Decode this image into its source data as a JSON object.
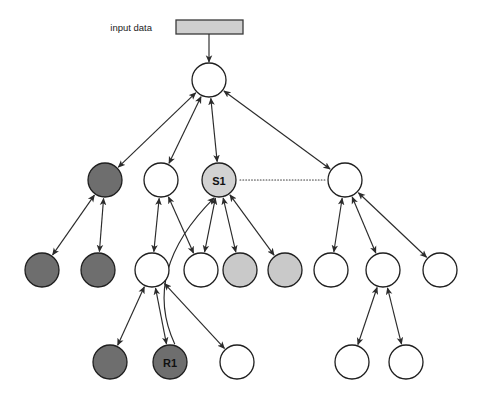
{
  "figure": {
    "title": "",
    "background": "#ffffff",
    "width": 479,
    "height": 403
  },
  "input_block": {
    "label": "input data",
    "label_x": 152,
    "label_y": 27,
    "rect": {
      "x": 176,
      "y": 20,
      "w": 67,
      "h": 14
    },
    "fill": "#cfcfcf",
    "stroke": "#3a3a3a",
    "feed_arrow": {
      "x1": 209,
      "y1": 34,
      "x2": 209,
      "y2": 62
    }
  },
  "palette": {
    "white": "#ffffff",
    "light_gray": "#d2d2d2",
    "mid_gray": "#c9c9c9",
    "dark_gray": "#6e6e6e",
    "node_stroke": "#1f1f1f",
    "edge": "#2b2b2b",
    "assoc_line": "#3a3a3a"
  },
  "nodes": [
    {
      "id": "root",
      "x": 209,
      "y": 80,
      "r": 17,
      "fill": "#ffffff",
      "label": ""
    },
    {
      "id": "n2a",
      "x": 105,
      "y": 180,
      "r": 17,
      "fill": "#6e6e6e",
      "label": ""
    },
    {
      "id": "n2b",
      "x": 161,
      "y": 180,
      "r": 17,
      "fill": "#ffffff",
      "label": ""
    },
    {
      "id": "S1",
      "x": 219,
      "y": 180,
      "r": 17,
      "fill": "#d2d2d2",
      "label": "S1"
    },
    {
      "id": "n2d",
      "x": 345,
      "y": 180,
      "r": 17,
      "fill": "#ffffff",
      "label": ""
    },
    {
      "id": "n3a",
      "x": 42,
      "y": 270,
      "r": 17,
      "fill": "#6e6e6e",
      "label": ""
    },
    {
      "id": "n3b",
      "x": 98,
      "y": 270,
      "r": 17,
      "fill": "#6e6e6e",
      "label": ""
    },
    {
      "id": "n3c",
      "x": 152,
      "y": 270,
      "r": 17,
      "fill": "#ffffff",
      "label": ""
    },
    {
      "id": "n3d",
      "x": 201,
      "y": 270,
      "r": 17,
      "fill": "#ffffff",
      "label": ""
    },
    {
      "id": "n3e",
      "x": 240,
      "y": 270,
      "r": 17,
      "fill": "#c9c9c9",
      "label": ""
    },
    {
      "id": "n3f",
      "x": 285,
      "y": 270,
      "r": 17,
      "fill": "#c9c9c9",
      "label": ""
    },
    {
      "id": "n3g",
      "x": 331,
      "y": 270,
      "r": 17,
      "fill": "#ffffff",
      "label": ""
    },
    {
      "id": "n3h",
      "x": 383,
      "y": 270,
      "r": 17,
      "fill": "#ffffff",
      "label": ""
    },
    {
      "id": "n3i",
      "x": 440,
      "y": 270,
      "r": 17,
      "fill": "#ffffff",
      "label": ""
    },
    {
      "id": "n4a",
      "x": 110,
      "y": 362,
      "r": 17,
      "fill": "#6e6e6e",
      "label": ""
    },
    {
      "id": "R1",
      "x": 170,
      "y": 362,
      "r": 17,
      "fill": "#6e6e6e",
      "label": "R1"
    },
    {
      "id": "n4c",
      "x": 237,
      "y": 362,
      "r": 17,
      "fill": "#ffffff",
      "label": ""
    },
    {
      "id": "n4d",
      "x": 352,
      "y": 362,
      "r": 17,
      "fill": "#ffffff",
      "label": ""
    },
    {
      "id": "n4e",
      "x": 406,
      "y": 362,
      "r": 17,
      "fill": "#ffffff",
      "label": ""
    }
  ],
  "edges": [
    {
      "from": "root",
      "to": "n2a",
      "arrows": "both"
    },
    {
      "from": "root",
      "to": "n2b",
      "arrows": "both"
    },
    {
      "from": "root",
      "to": "S1",
      "arrows": "both"
    },
    {
      "from": "root",
      "to": "n2d",
      "arrows": "both"
    },
    {
      "from": "n2a",
      "to": "n3a",
      "arrows": "both"
    },
    {
      "from": "n2a",
      "to": "n3b",
      "arrows": "both"
    },
    {
      "from": "n2b",
      "to": "n3c",
      "arrows": "both"
    },
    {
      "from": "n2b",
      "to": "n3d",
      "arrows": "both"
    },
    {
      "from": "S1",
      "to": "n3d",
      "arrows": "both"
    },
    {
      "from": "S1",
      "to": "n3e",
      "arrows": "both"
    },
    {
      "from": "S1",
      "to": "n3f",
      "arrows": "both"
    },
    {
      "from": "n2d",
      "to": "n3g",
      "arrows": "both"
    },
    {
      "from": "n2d",
      "to": "n3h",
      "arrows": "both"
    },
    {
      "from": "n2d",
      "to": "n3i",
      "arrows": "both"
    },
    {
      "from": "n3c",
      "to": "n4a",
      "arrows": "both"
    },
    {
      "from": "n3c",
      "to": "R1",
      "arrows": "both"
    },
    {
      "from": "n3c",
      "to": "n4c",
      "arrows": "both"
    },
    {
      "from": "n3h",
      "to": "n4d",
      "arrows": "both"
    },
    {
      "from": "n3h",
      "to": "n4e",
      "arrows": "both"
    }
  ],
  "long_edge": {
    "from": "R1",
    "to": "S1",
    "description": "curved long edge from R1 up to S1",
    "arrows": "end"
  },
  "association": {
    "from": "S1",
    "to": "n2d",
    "style": "dotted",
    "x1": 240,
    "x2": 326,
    "y": 180
  }
}
